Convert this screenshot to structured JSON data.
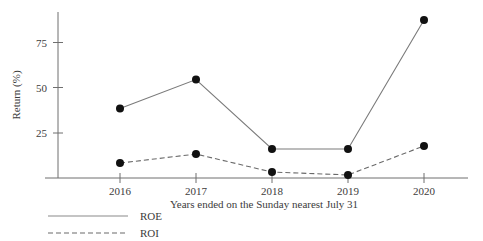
{
  "chart_data": {
    "type": "line",
    "title": "",
    "xlabel": "Years ended on the Sunday nearest July 31",
    "ylabel": "Return (%)",
    "categories": [
      "2016",
      "2017",
      "2018",
      "2019",
      "2020"
    ],
    "xtick_labels": [
      "2016",
      "2017",
      "2018",
      "2019",
      "2020"
    ],
    "ytick_labels": [
      "25",
      "50",
      "75"
    ],
    "yticks": [
      25,
      50,
      75
    ],
    "ylim": [
      0,
      95
    ],
    "grid": false,
    "legend_position": "bottom-left",
    "series": [
      {
        "name": "ROE",
        "style": "solid",
        "marker": "filled-circle",
        "values": [
          38.6,
          54.7,
          16.1,
          16.1,
          87.8
        ]
      },
      {
        "name": "ROI",
        "style": "dashed",
        "marker": "filled-circle",
        "values": [
          8.3,
          13.3,
          3.3,
          1.7,
          17.8
        ]
      }
    ]
  },
  "legend": {
    "entries": [
      {
        "label": "ROE",
        "style": "solid"
      },
      {
        "label": "ROI",
        "style": "dashed"
      }
    ]
  },
  "axes": {
    "y_axis_title": "Return (%)",
    "x_axis_title": "Years ended on the Sunday nearest July 31",
    "y_tick_0": "25",
    "y_tick_1": "50",
    "y_tick_2": "75",
    "x_tick_0": "2016",
    "x_tick_1": "2017",
    "x_tick_2": "2018",
    "x_tick_3": "2019",
    "x_tick_4": "2020"
  },
  "colors": {
    "axis": "#6f6f6f",
    "roe_line": "#7a7a7a",
    "roi_line": "#6a6a6a",
    "marker": "#111111",
    "text": "#3c3c3c",
    "background": "#ffffff"
  }
}
